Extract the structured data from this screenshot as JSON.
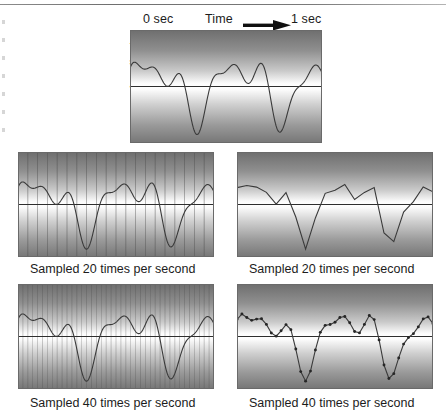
{
  "figure": {
    "title_present": false,
    "axis_labels": {
      "start_time": "0 sec",
      "time": "Time",
      "end_time": "1 sec",
      "amplitude": "Amplitude"
    },
    "arrow_icon": "right-arrow-icon"
  },
  "panels": [
    {
      "id": "original",
      "role": "original-analog-waveform",
      "caption": "",
      "gridlines": 0,
      "markers": false,
      "render": "smooth"
    },
    {
      "id": "grid-20",
      "role": "waveform-with-20-sample-gridlines",
      "caption": "Sampled 20 times per second",
      "gridlines": 20,
      "markers": false,
      "render": "smooth"
    },
    {
      "id": "recon-20",
      "role": "reconstruction-from-20-samples",
      "caption": "Sampled 20 times per second",
      "gridlines": 0,
      "markers": false,
      "render": "piecewise-linear"
    },
    {
      "id": "grid-40",
      "role": "waveform-with-40-sample-gridlines",
      "caption": "Sampled 40 times per second",
      "gridlines": 40,
      "markers": false,
      "render": "smooth"
    },
    {
      "id": "recon-40",
      "role": "reconstruction-from-40-samples",
      "caption": "Sampled 40 times per second",
      "gridlines": 0,
      "markers": true,
      "render": "piecewise-linear"
    }
  ],
  "colors": {
    "curve": "#3a3a3a",
    "zero_axis": "#2e2e2e",
    "gridline": "#4a4a4a",
    "marker": "#262626",
    "panel_border": "#6a6a6a",
    "text": "#1c1c1c",
    "page_background": "#ffffff"
  },
  "chart_data": {
    "type": "line",
    "title": "",
    "xlabel": "Time",
    "ylabel": "Amplitude",
    "xlim": [
      0,
      1
    ],
    "ylim": [
      -1,
      1
    ],
    "x_tick_labels": [
      "0 sec",
      "1 sec"
    ],
    "grid": false,
    "legend": "none",
    "signal_formula": "y(t) = 0.52*sin(2*pi*2.2*t) + 0.34*sin(2*pi*4.6*t + 0.6) + 0.22*sin(2*pi*7.1*t + 1.9)",
    "sample_rates_hz": [
      20,
      40
    ],
    "duration_seconds": 1,
    "series": [
      {
        "name": "analog waveform",
        "x": [
          0.0,
          0.02,
          0.04,
          0.06,
          0.08,
          0.1,
          0.12,
          0.14,
          0.16,
          0.18,
          0.2,
          0.22,
          0.24,
          0.26,
          0.28,
          0.3,
          0.32,
          0.34,
          0.36,
          0.38,
          0.4,
          0.42,
          0.44,
          0.46,
          0.48,
          0.5,
          0.52,
          0.54,
          0.56,
          0.58,
          0.6,
          0.62,
          0.64,
          0.66,
          0.68,
          0.7,
          0.72,
          0.74,
          0.76,
          0.78,
          0.8,
          0.82,
          0.84,
          0.86,
          0.88,
          0.9,
          0.92,
          0.94,
          0.96,
          0.98,
          1.0
        ],
        "y": [
          0.0,
          0.23,
          0.45,
          0.57,
          0.56,
          0.45,
          0.31,
          0.25,
          0.34,
          0.57,
          0.82,
          0.96,
          0.93,
          0.72,
          0.37,
          -0.03,
          -0.37,
          -0.56,
          -0.57,
          -0.43,
          -0.21,
          0.03,
          0.22,
          0.33,
          0.35,
          0.28,
          0.14,
          -0.04,
          -0.25,
          -0.46,
          -0.65,
          -0.79,
          -0.86,
          -0.85,
          -0.73,
          -0.52,
          -0.23,
          0.1,
          0.42,
          0.68,
          0.84,
          0.88,
          0.8,
          0.6,
          0.33,
          0.02,
          -0.29,
          -0.56,
          -0.74,
          -0.79,
          -0.7
        ]
      },
      {
        "name": "20 Hz samples",
        "x": [
          0.0,
          0.05,
          0.1,
          0.15,
          0.2,
          0.25,
          0.3,
          0.35,
          0.4,
          0.45,
          0.5,
          0.55,
          0.6,
          0.65,
          0.7,
          0.75,
          0.8,
          0.85,
          0.9,
          0.95,
          1.0
        ],
        "y": [
          0.0,
          0.52,
          0.45,
          0.44,
          0.82,
          0.55,
          -0.03,
          -0.57,
          -0.21,
          0.3,
          0.28,
          -0.15,
          -0.65,
          -0.86,
          -0.52,
          0.26,
          0.84,
          0.72,
          0.02,
          -0.66,
          -0.7
        ]
      },
      {
        "name": "40 Hz samples",
        "x": [
          0.0,
          0.025,
          0.05,
          0.075,
          0.1,
          0.125,
          0.15,
          0.175,
          0.2,
          0.225,
          0.25,
          0.275,
          0.3,
          0.325,
          0.35,
          0.375,
          0.4,
          0.425,
          0.45,
          0.475,
          0.5,
          0.525,
          0.55,
          0.575,
          0.6,
          0.625,
          0.65,
          0.675,
          0.7,
          0.725,
          0.75,
          0.775,
          0.8,
          0.825,
          0.85,
          0.875,
          0.9,
          0.925,
          0.95,
          0.975,
          1.0
        ],
        "y": [
          0.0,
          0.3,
          0.52,
          0.53,
          0.45,
          0.27,
          0.44,
          0.72,
          0.82,
          0.94,
          0.55,
          -0.06,
          -0.03,
          -0.54,
          -0.57,
          -0.31,
          -0.21,
          0.14,
          0.3,
          0.35,
          0.28,
          0.1,
          -0.15,
          -0.41,
          -0.65,
          -0.82,
          -0.86,
          -0.78,
          -0.52,
          -0.14,
          0.26,
          0.58,
          0.84,
          0.88,
          0.72,
          0.46,
          0.02,
          -0.36,
          -0.66,
          -0.79,
          -0.7
        ]
      }
    ]
  }
}
